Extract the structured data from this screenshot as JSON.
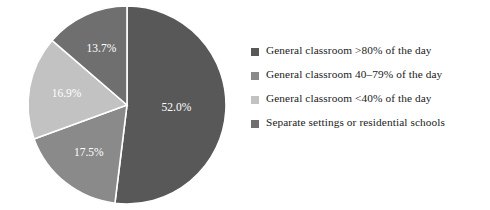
{
  "chart_data": {
    "type": "pie",
    "title": "",
    "subtitle": "",
    "xlabel": "",
    "ylabel": "",
    "grid": false,
    "legend_position": "right",
    "start_angle_deg": 0,
    "direction": "clockwise",
    "categories": [
      "General classroom >80% of the day",
      "General classroom 40–79% of the day",
      "General classroom <40% of the day",
      "Separate settings or residential schools"
    ],
    "values": [
      52.0,
      17.5,
      16.9,
      13.7
    ],
    "data_labels": [
      "52.0%",
      "17.5%",
      "16.9%",
      "13.7%"
    ],
    "colors": [
      "#585858",
      "#8a8a8a",
      "#c2c2c2",
      "#6f6f6f"
    ],
    "slices": [
      {
        "label": "General classroom >80% of the day",
        "value": 52.0,
        "data_label": "52.0%",
        "color": "#585858"
      },
      {
        "label": "General classroom 40–79% of the day",
        "value": 17.5,
        "data_label": "17.5%",
        "color": "#8a8a8a"
      },
      {
        "label": "General classroom <40% of the day",
        "value": 16.9,
        "data_label": "16.9%",
        "color": "#c2c2c2"
      },
      {
        "label": "Separate settings or residential schools",
        "value": 13.7,
        "data_label": "13.7%",
        "color": "#6f6f6f"
      }
    ]
  },
  "legend": {
    "items": [
      {
        "label": "General classroom >80% of the day",
        "color": "#585858"
      },
      {
        "label": "General classroom 40–79% of the day",
        "color": "#8a8a8a"
      },
      {
        "label": "General classroom <40% of the day",
        "color": "#c2c2c2"
      },
      {
        "label": "Separate settings or residential schools",
        "color": "#6f6f6f"
      }
    ]
  },
  "style": {
    "background": "#ffffff",
    "slice_border": "#ffffff",
    "label_text_color": "#ffffff",
    "legend_text_color": "#1b1b1b"
  }
}
